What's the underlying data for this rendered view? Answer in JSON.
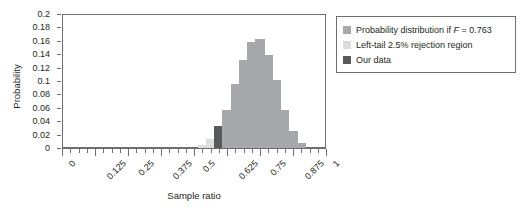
{
  "chart_data": {
    "type": "bar",
    "title": "",
    "xlabel": "Sample ratio",
    "ylabel": "Probability",
    "xlim": [
      0,
      1
    ],
    "ylim": [
      0,
      0.2
    ],
    "grid": false,
    "legend_position": "right-outside",
    "y_ticks": [
      "0",
      "0.02",
      "0.04",
      "0.06",
      "0.08",
      "0.1",
      "0.12",
      "0.14",
      "0.16",
      "0.18",
      "0.2"
    ],
    "y_tick_values": [
      0,
      0.02,
      0.04,
      0.06,
      0.08,
      0.1,
      0.12,
      0.14,
      0.16,
      0.18,
      0.2
    ],
    "x_ticks": [
      "0",
      "0.125",
      "0.25",
      "0.375",
      "0.5",
      "0.625",
      "0.75",
      "0.875",
      "1"
    ],
    "x_tick_values": [
      0,
      0.125,
      0.25,
      0.375,
      0.5,
      0.625,
      0.75,
      0.875,
      1
    ],
    "x_minor_tick_step": 0.03125,
    "bar_width_ratio": 0.55,
    "categories": [
      0.53125,
      0.5625,
      0.59375,
      0.625,
      0.65625,
      0.6875,
      0.71875,
      0.75,
      0.78125,
      0.8125,
      0.84375,
      0.875,
      0.90625
    ],
    "values": [
      0.004,
      0.013,
      0.033,
      0.057,
      0.095,
      0.131,
      0.158,
      0.163,
      0.139,
      0.102,
      0.057,
      0.026,
      0.008
    ],
    "bar_classes": [
      "reject",
      "reject",
      "ourdata",
      "dist",
      "dist",
      "dist",
      "dist",
      "dist",
      "dist",
      "dist",
      "dist",
      "dist",
      "dist"
    ],
    "series": [
      {
        "name": "Probability distribution if F = 0.763",
        "color": "#a6a8ab",
        "x": [
          0.625,
          0.65625,
          0.6875,
          0.71875,
          0.75,
          0.78125,
          0.8125,
          0.84375,
          0.875,
          0.90625
        ],
        "values": [
          0.057,
          0.095,
          0.131,
          0.158,
          0.163,
          0.139,
          0.102,
          0.057,
          0.026,
          0.008
        ]
      },
      {
        "name": "Left-tail 2.5% rejection region",
        "color": "#dcddde",
        "x": [
          0.53125,
          0.5625
        ],
        "values": [
          0.004,
          0.013
        ]
      },
      {
        "name": "Our data",
        "color": "#58595b",
        "x": [
          0.59375
        ],
        "values": [
          0.033
        ]
      }
    ],
    "annotations": []
  },
  "legend": {
    "items": [
      {
        "label_prefix": "Probability distribution if ",
        "label_italic": "F",
        "label_suffix": " = 0.763",
        "swatch": "dist"
      },
      {
        "label_prefix": "Left-tail 2.5% rejection region",
        "label_italic": "",
        "label_suffix": "",
        "swatch": "reject"
      },
      {
        "label_prefix": "Our data",
        "label_italic": "",
        "label_suffix": "",
        "swatch": "ourdata"
      }
    ]
  },
  "axes": {
    "x_title": "Sample ratio",
    "y_title": "Probability"
  },
  "colors": {
    "distribution": "#a6a8ab",
    "rejection": "#dcddde",
    "our_data": "#58595b",
    "axis": "#6d6e71",
    "text": "#231f20",
    "background": "#ffffff"
  }
}
